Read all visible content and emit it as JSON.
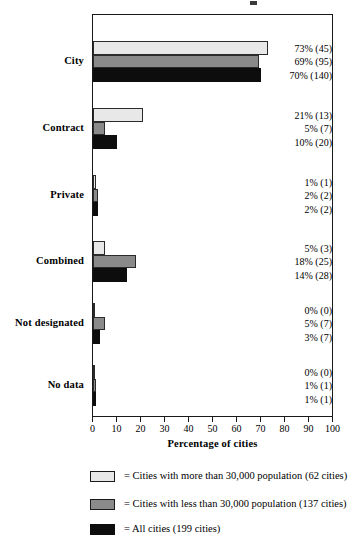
{
  "chart_data": {
    "type": "bar",
    "orientation": "horizontal",
    "title": "",
    "xlabel": "Percentage of cities",
    "ylabel": "",
    "xlim": [
      0,
      100
    ],
    "xticks": [
      0,
      10,
      20,
      30,
      40,
      50,
      60,
      70,
      80,
      90,
      100
    ],
    "grid": false,
    "legend_position": "below",
    "categories": [
      "City",
      "Contract",
      "Private",
      "Combined",
      "Not designated",
      "No data"
    ],
    "series": [
      {
        "name": "Cities with more than 30,000 population (62 cities)",
        "swatch": "light",
        "color": "#e8e8e8",
        "values": [
          73,
          21,
          1,
          5,
          0,
          0
        ],
        "counts": [
          45,
          13,
          1,
          3,
          0,
          0
        ],
        "labels": [
          "73% (45)",
          "21% (13)",
          "1% (1)",
          "5% (3)",
          "0% (0)",
          "0% (0)"
        ]
      },
      {
        "name": "Cities with less than 30,000 population (137 cities)",
        "swatch": "gray",
        "color": "#8a8a8a",
        "values": [
          69,
          5,
          2,
          18,
          5,
          1
        ],
        "counts": [
          95,
          7,
          2,
          25,
          7,
          1
        ],
        "labels": [
          "69% (95)",
          "5% (7)",
          "2% (2)",
          "18% (25)",
          "5% (7)",
          "1% (1)"
        ]
      },
      {
        "name": "All cities (199 cities)",
        "swatch": "black",
        "color": "#0d0d0d",
        "values": [
          70,
          10,
          2,
          14,
          3,
          1
        ],
        "counts": [
          140,
          20,
          2,
          28,
          7,
          1
        ],
        "labels": [
          "70% (140)",
          "10% (20)",
          "2% (2)",
          "14% (28)",
          "3% (7)",
          "1% (1)"
        ]
      }
    ]
  },
  "axis": {
    "x_title": "Percentage of cities",
    "tick_labels": [
      "0",
      "10",
      "20",
      "30",
      "40",
      "50",
      "60",
      "70",
      "80",
      "90",
      "100"
    ]
  },
  "legend": {
    "entries": [
      {
        "swatch": "light",
        "text": "= Cities with more than 30,000 population (62 cities)"
      },
      {
        "swatch": "gray",
        "text": "= Cities with less than 30,000 population (137 cities)"
      },
      {
        "swatch": "black",
        "text": "= All cities (199 cities)"
      }
    ]
  }
}
